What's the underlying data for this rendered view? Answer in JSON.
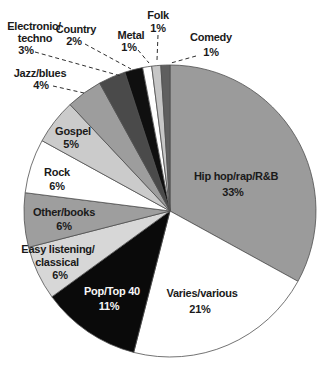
{
  "chart_data": {
    "type": "pie",
    "title": "",
    "units": "percent",
    "total": 100,
    "start_angle": "top",
    "direction": "clockwise",
    "layout": {
      "cx": 170,
      "cy": 211,
      "r": 146,
      "slice_stroke": "#4f4f4f",
      "leader_style": "dashed"
    },
    "slices": [
      {
        "id": "hip-hop-rap-rnb",
        "label": "Hip hop/rap/R&B",
        "value": 33,
        "pct_label": "33%",
        "color": "#9b9b9b",
        "label_placement": "inside",
        "label_color": "#1a1a1a",
        "lines": [
          {
            "t": "Hip hop/rap/R&B",
            "x": 236,
            "y": 180
          },
          {
            "t": "33%",
            "x": 233,
            "y": 196
          }
        ]
      },
      {
        "id": "varies-various",
        "label": "Varies/various",
        "value": 21,
        "pct_label": "21%",
        "color": "#ffffff",
        "label_placement": "inside",
        "label_color": "#1a1a1a",
        "lines": [
          {
            "t": "Varies/various",
            "x": 202,
            "y": 297
          },
          {
            "t": "21%",
            "x": 200,
            "y": 313
          }
        ]
      },
      {
        "id": "pop-top-40",
        "label": "Pop/Top 40",
        "value": 11,
        "pct_label": "11%",
        "color": "#0a0a0a",
        "label_placement": "inside",
        "label_color": "#f7f7f7",
        "lines": [
          {
            "t": "Pop/Top 40",
            "x": 112,
            "y": 295
          },
          {
            "t": "11%",
            "x": 109,
            "y": 310
          }
        ]
      },
      {
        "id": "easy-listening-classical",
        "label": "Easy listening/classical",
        "value": 6,
        "pct_label": "6%",
        "color": "#d7d7d7",
        "label_placement": "inside",
        "label_color": "#1a1a1a",
        "lines": [
          {
            "t": "Easy listening/",
            "x": 58,
            "y": 253
          },
          {
            "t": "classical",
            "x": 57,
            "y": 266
          },
          {
            "t": "6%",
            "x": 60,
            "y": 279
          }
        ]
      },
      {
        "id": "other-books",
        "label": "Other/books",
        "value": 6,
        "pct_label": "6%",
        "color": "#9e9e9e",
        "label_placement": "inside",
        "label_color": "#1a1a1a",
        "lines": [
          {
            "t": "Other/books",
            "x": 64,
            "y": 216
          },
          {
            "t": "6%",
            "x": 64,
            "y": 230
          }
        ]
      },
      {
        "id": "rock",
        "label": "Rock",
        "value": 6,
        "pct_label": "6%",
        "color": "#ffffff",
        "label_placement": "inside",
        "label_color": "#1a1a1a",
        "lines": [
          {
            "t": "Rock",
            "x": 57,
            "y": 176
          },
          {
            "t": "6%",
            "x": 57,
            "y": 190
          }
        ]
      },
      {
        "id": "gospel",
        "label": "Gospel",
        "value": 5,
        "pct_label": "5%",
        "color": "#cbcbcb",
        "label_placement": "inside",
        "label_color": "#1a1a1a",
        "lines": [
          {
            "t": "Gospel",
            "x": 73,
            "y": 135
          },
          {
            "t": "5%",
            "x": 71,
            "y": 148
          }
        ]
      },
      {
        "id": "jazz-blues",
        "label": "Jazz/blues",
        "value": 4,
        "pct_label": "4%",
        "color": "#9d9d9d",
        "label_placement": "outside",
        "label_color": "#1a1a1a",
        "lines": [
          {
            "t": "Jazz/blues",
            "x": 40,
            "y": 77
          },
          {
            "t": "4%",
            "x": 41,
            "y": 89
          }
        ],
        "leader": {
          "x1": 53,
          "y1": 86,
          "x2": 84,
          "y2": 93
        }
      },
      {
        "id": "electronic-techno",
        "label": "Electronic/techno",
        "value": 3,
        "pct_label": "3%",
        "color": "#4a4a4a",
        "label_placement": "outside",
        "label_color": "#1a1a1a",
        "lines": [
          {
            "t": "Electronic/",
            "x": 34,
            "y": 30
          },
          {
            "t": "techno",
            "x": 35,
            "y": 42
          },
          {
            "t": "3%",
            "x": 26,
            "y": 54
          }
        ],
        "leader": {
          "x1": 35,
          "y1": 52,
          "x2": 121,
          "y2": 76
        }
      },
      {
        "id": "country",
        "label": "Country",
        "value": 2,
        "pct_label": "2%",
        "color": "#0f0f0f",
        "label_placement": "outside",
        "label_color": "#1a1a1a",
        "lines": [
          {
            "t": "Country",
            "x": 76,
            "y": 33
          },
          {
            "t": "2%",
            "x": 74,
            "y": 45
          }
        ],
        "leader": {
          "x1": 85,
          "y1": 44,
          "x2": 131,
          "y2": 69
        }
      },
      {
        "id": "metal",
        "label": "Metal",
        "value": 1,
        "pct_label": "1%",
        "color": "#ffffff",
        "label_placement": "outside",
        "label_color": "#1a1a1a",
        "lines": [
          {
            "t": "Metal",
            "x": 131,
            "y": 39
          },
          {
            "t": "1%",
            "x": 129,
            "y": 51
          }
        ],
        "leader": {
          "x1": 138,
          "y1": 50,
          "x2": 149,
          "y2": 63
        }
      },
      {
        "id": "folk",
        "label": "Folk",
        "value": 1,
        "pct_label": "1%",
        "color": "#c6c6c6",
        "label_placement": "outside",
        "label_color": "#1a1a1a",
        "lines": [
          {
            "t": "Folk",
            "x": 158,
            "y": 19
          },
          {
            "t": "1%",
            "x": 158,
            "y": 32
          }
        ],
        "leader": {
          "x1": 158,
          "y1": 35,
          "x2": 157,
          "y2": 60
        }
      },
      {
        "id": "comedy",
        "label": "Comedy",
        "value": 1,
        "pct_label": "1%",
        "color": "#5f5f5f",
        "label_placement": "outside",
        "label_color": "#1a1a1a",
        "lines": [
          {
            "t": "Comedy",
            "x": 211,
            "y": 41
          },
          {
            "t": "1%",
            "x": 211,
            "y": 56
          }
        ],
        "leader": {
          "x1": 196,
          "y1": 56,
          "x2": 171,
          "y2": 63
        }
      }
    ]
  }
}
